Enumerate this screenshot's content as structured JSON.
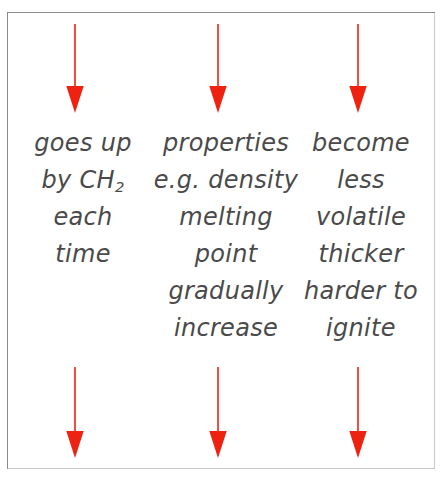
{
  "diagram": {
    "frame": {
      "border_color": "#8a8a8a",
      "background_color": "#ffffff"
    },
    "arrow_color": "#ee2211",
    "text_color": "#4a4a4a",
    "arrows_top": [
      {
        "name": "top-arrow-1",
        "direction": "down"
      },
      {
        "name": "top-arrow-2",
        "direction": "down"
      },
      {
        "name": "top-arrow-3",
        "direction": "down"
      }
    ],
    "arrows_bottom": [
      {
        "name": "bottom-arrow-1",
        "direction": "down"
      },
      {
        "name": "bottom-arrow-2",
        "direction": "down"
      },
      {
        "name": "bottom-arrow-3",
        "direction": "down"
      }
    ],
    "columns": [
      {
        "id": "column-1",
        "lines": [
          {
            "text": "goes up"
          },
          {
            "pre": "by CH",
            "sub": "2",
            "post": ""
          },
          {
            "text": "each"
          },
          {
            "text": "time"
          }
        ]
      },
      {
        "id": "column-2",
        "lines": [
          {
            "text": "properties"
          },
          {
            "text": "e.g. density"
          },
          {
            "text": "melting"
          },
          {
            "text": "point"
          },
          {
            "text": "gradually"
          },
          {
            "text": "increase"
          }
        ]
      },
      {
        "id": "column-3",
        "lines": [
          {
            "text": "become"
          },
          {
            "text": "less"
          },
          {
            "text": "volatile"
          },
          {
            "text": "thicker"
          },
          {
            "text": "harder to"
          },
          {
            "text": "ignite"
          }
        ]
      }
    ]
  }
}
